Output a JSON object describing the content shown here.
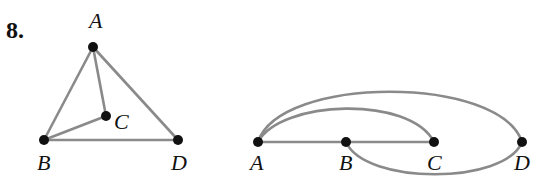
{
  "problem_number": "8.",
  "colors": {
    "edge": "#8a8a8a",
    "vertex": "#111111",
    "background": "#ffffff"
  },
  "left_graph": {
    "labels": {
      "A": "A",
      "B": "B",
      "C": "C",
      "D": "D"
    },
    "vertices": [
      {
        "id": "A",
        "x": 93,
        "y": 47
      },
      {
        "id": "B",
        "x": 44,
        "y": 140
      },
      {
        "id": "C",
        "x": 106,
        "y": 116
      },
      {
        "id": "D",
        "x": 178,
        "y": 140
      }
    ],
    "edges": [
      [
        "A",
        "B"
      ],
      [
        "A",
        "C"
      ],
      [
        "A",
        "D"
      ],
      [
        "B",
        "C"
      ],
      [
        "B",
        "D"
      ]
    ]
  },
  "right_graph": {
    "labels": {
      "A": "A",
      "B": "B",
      "C": "C",
      "D": "D"
    },
    "vertices": [
      {
        "id": "A",
        "x": 258,
        "y": 142
      },
      {
        "id": "B",
        "x": 346,
        "y": 142
      },
      {
        "id": "C",
        "x": 434,
        "y": 142
      },
      {
        "id": "D",
        "x": 522,
        "y": 142
      }
    ],
    "edges": [
      [
        "A",
        "B"
      ],
      [
        "B",
        "C"
      ],
      [
        "A",
        "C"
      ],
      [
        "A",
        "D"
      ],
      [
        "B",
        "D"
      ]
    ]
  }
}
